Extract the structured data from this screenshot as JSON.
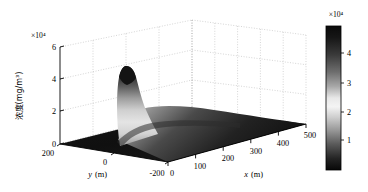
{
  "figure": {
    "kind": "matlab-3d-surface-plot",
    "background_color": "#ffffff",
    "width": 368,
    "height": 192
  },
  "chart_data": {
    "type": "surface",
    "title": "",
    "subtitle": "",
    "xlabel": "x (m)",
    "ylabel": "y (m)",
    "zlabel": "浓度(mg/m³)",
    "z_exponent_label": "×10⁴",
    "grid": true,
    "legend": "none",
    "xlim": [
      0,
      500
    ],
    "ylim": [
      -200,
      200
    ],
    "zlim": [
      0,
      60000
    ],
    "xticks": [
      0,
      100,
      200,
      300,
      400,
      500
    ],
    "xtick_labels": [
      "0",
      "100",
      "200",
      "300",
      "400",
      "500"
    ],
    "yticks": [
      200,
      0,
      -200
    ],
    "ytick_labels": [
      "200",
      "0",
      "-200"
    ],
    "zticks": [
      0,
      20000,
      40000,
      60000
    ],
    "ztick_labels": [
      "0",
      "2",
      "4",
      "6"
    ],
    "z_tick_scale": 10000,
    "peak": {
      "approx_x_m": 60,
      "approx_y_m": 0,
      "approx_z_value": 35000,
      "description": "single gaussian plume peak near the x origin rising to about 3.5 x 10^4 mg/m^3"
    },
    "surface_description": "dark flat base field across the x-y domain with one tall narrow ridge/plume near x=60 m decaying downstream toward large x",
    "colormap": "gray-nonmonotonic-dark-light-dark"
  },
  "colorbar": {
    "exponent_label": "×10⁴",
    "tick_labels": [
      "4",
      "3",
      "2",
      "1"
    ],
    "tick_values": [
      40000,
      30000,
      20000,
      10000
    ],
    "scale": 10000,
    "orientation": "vertical",
    "border_color": "#000000",
    "gradient_stops": [
      {
        "offset": "0%",
        "color": "#0a0a0a"
      },
      {
        "offset": "8%",
        "color": "#161616"
      },
      {
        "offset": "20%",
        "color": "#3a3a3a"
      },
      {
        "offset": "32%",
        "color": "#6e6e6e"
      },
      {
        "offset": "42%",
        "color": "#a8a8a8"
      },
      {
        "offset": "50%",
        "color": "#e8e8e8"
      },
      {
        "offset": "56%",
        "color": "#f4f4f4"
      },
      {
        "offset": "63%",
        "color": "#d0d0d0"
      },
      {
        "offset": "72%",
        "color": "#9a9a9a"
      },
      {
        "offset": "82%",
        "color": "#5a5a5a"
      },
      {
        "offset": "92%",
        "color": "#242424"
      },
      {
        "offset": "100%",
        "color": "#080808"
      }
    ]
  },
  "axes": {
    "z_exponent": "×10⁴",
    "z_ticks": [
      "6",
      "4",
      "2",
      "0"
    ],
    "y_ticks": [
      "200",
      "0",
      "-200"
    ],
    "x_ticks": [
      "0",
      "100",
      "200",
      "300",
      "400",
      "500"
    ],
    "x_name": "x",
    "x_unit": "(m)",
    "y_name": "y",
    "y_unit": "(m)",
    "z_name": "浓度(mg/m³)",
    "grid_color": "#b9b9b9",
    "axis_line_color": "#000000"
  }
}
